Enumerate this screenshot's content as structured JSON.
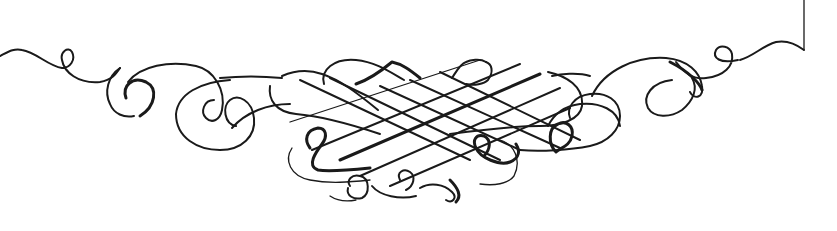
{
  "image": {
    "description": "Calligraphic flourish ornament (pen-drawn scrollwork divider)",
    "background_color": "#ffffff",
    "ink_color": "#1a1a1a",
    "elements": [
      {
        "name": "left-tail-flourish"
      },
      {
        "name": "left-scroll-curls"
      },
      {
        "name": "central-lattice-knot"
      },
      {
        "name": "lower-center-loops"
      },
      {
        "name": "right-scroll-curls"
      },
      {
        "name": "right-tail-flourish"
      },
      {
        "name": "top-right-frame-corner"
      }
    ]
  }
}
